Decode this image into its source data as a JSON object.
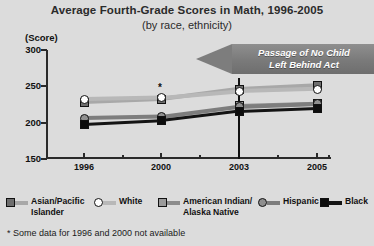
{
  "chart_data": {
    "type": "line",
    "title": "Average Fourth-Grade Scores in Math, 1996-2005",
    "subtitle": "(by race, ethnicity)",
    "ylabel": "(Score)",
    "xlabel": "",
    "ylim": [
      150,
      300
    ],
    "yticks": [
      300,
      250,
      200,
      150
    ],
    "x": [
      "1996",
      "2000",
      "2003",
      "2005"
    ],
    "grid": false,
    "legend_position": "bottom",
    "series": [
      {
        "name": "Asian/Pacific Islander",
        "marker": "square",
        "color": "#a8a8a8",
        "marker_fill": "#6e6e6e",
        "values": [
          228,
          232,
          246,
          251
        ]
      },
      {
        "name": "White",
        "marker": "circle",
        "color": "#b8b8b8",
        "marker_fill": "#ffffff",
        "values": [
          232,
          234,
          243,
          246
        ]
      },
      {
        "name": "American Indian/ Alaska Native",
        "marker": "square",
        "color": "#8c8c8c",
        "marker_fill": "#9a9a9a",
        "values": [
          null,
          null,
          223,
          226
        ]
      },
      {
        "name": "Hispanic",
        "marker": "circle",
        "color": "#7d7d7d",
        "marker_fill": "#8f8f8f",
        "values": [
          206,
          208,
          222,
          226
        ]
      },
      {
        "name": "Black",
        "marker": "square",
        "color": "#141414",
        "marker_fill": "#0d0d0d",
        "values": [
          198,
          203,
          216,
          220
        ]
      }
    ],
    "annotations": [
      {
        "name": "nclb-arrow",
        "text_line1": "Passage of No Child",
        "text_line2": "Left Behind Act",
        "points_to": "2003"
      },
      {
        "name": "asterisk",
        "text": "*",
        "at_x": "2000"
      }
    ],
    "footnote": "* Some data for 1996 and 2000 not available"
  },
  "legend": {
    "items": [
      {
        "label_line1": "Asian/Pacific",
        "label_line2": "Islander"
      },
      {
        "label_line1": "White",
        "label_line2": ""
      },
      {
        "label_line1": "American Indian/",
        "label_line2": "Alaska Native"
      },
      {
        "label_line1": "Hispanic",
        "label_line2": ""
      },
      {
        "label_line1": "Black",
        "label_line2": ""
      }
    ]
  },
  "colors": {
    "background": "#dcdcdc",
    "axis": "#2a2a2a",
    "banner": "#7a7a7a",
    "banner_text": "#ffffff"
  }
}
